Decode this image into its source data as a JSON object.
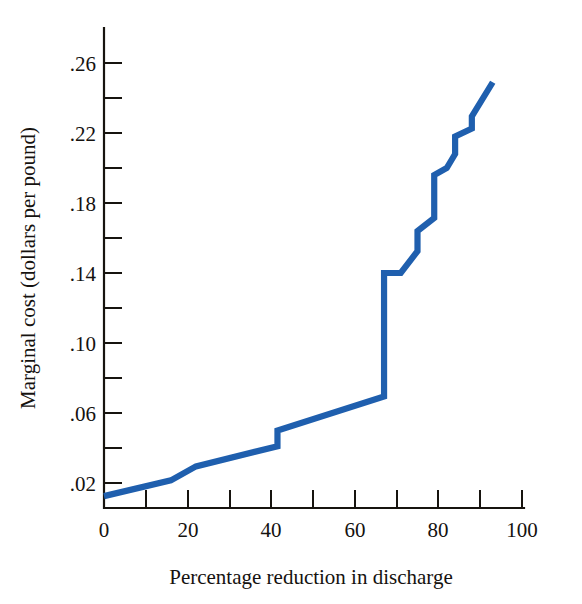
{
  "chart_data": {
    "type": "line",
    "title": "",
    "subtitle": "",
    "xlabel": "Percentage reduction in discharge",
    "ylabel": "Marginal cost (dollars per pound)",
    "xlim": [
      0,
      104
    ],
    "ylim": [
      0,
      0.2725
    ],
    "xticks": [
      0,
      10,
      20,
      30,
      40,
      50,
      60,
      70,
      80,
      90,
      100
    ],
    "xticklabels": [
      "0",
      "",
      "20",
      "",
      "40",
      "",
      "60",
      "",
      "80",
      "",
      "100"
    ],
    "yticks": [
      0.02,
      0.04,
      0.06,
      0.08,
      0.1,
      0.12,
      0.14,
      0.16,
      0.18,
      0.2,
      0.22,
      0.24,
      0.26
    ],
    "yticklabels": [
      ".02",
      "",
      ".06",
      "",
      ".10",
      "",
      ".14",
      "",
      ".18",
      "",
      ".22",
      "",
      ".26"
    ],
    "grid": false,
    "legend": false,
    "series": [
      {
        "name": "Marginal cost of discharge reduction",
        "color": "#1f5fae",
        "x": [
          0,
          16,
          22,
          41.5,
          41.5,
          67,
          67,
          71,
          75,
          75,
          79,
          79,
          82,
          84,
          84,
          88,
          88,
          93
        ],
        "y": [
          0.0125,
          0.0215,
          0.0295,
          0.041,
          0.05,
          0.0695,
          0.14,
          0.14,
          0.1525,
          0.164,
          0.1715,
          0.196,
          0.2,
          0.208,
          0.218,
          0.2225,
          0.2295,
          0.249
        ]
      }
    ]
  },
  "axes": {
    "y_tick_labels": [
      ".26",
      ".22",
      ".18",
      ".14",
      ".10",
      ".06",
      ".02"
    ],
    "x_tick_labels": [
      "0",
      "20",
      "40",
      "60",
      "80",
      "100"
    ],
    "x_axis_title": "Percentage reduction in discharge",
    "y_axis_title": "Marginal cost (dollars per pound)"
  },
  "colors": {
    "line": "#1f5fae",
    "axis": "#17140f",
    "background": "#ffffff"
  }
}
